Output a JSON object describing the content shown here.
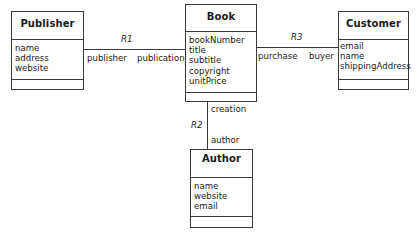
{
  "classes": {
    "publisher": {
      "name": "Publisher",
      "attributes": [
        "name",
        "address",
        "website"
      ]
    },
    "book": {
      "name": "Book",
      "attributes": [
        "bookNumber",
        "title",
        "subtitle",
        "copyright",
        "unitPrice"
      ]
    },
    "customer": {
      "name": "Customer",
      "attributes": [
        "email",
        "name",
        "shippingAddress"
      ]
    },
    "author": {
      "name": "Author",
      "attributes": [
        "name",
        "website",
        "email"
      ]
    }
  },
  "associations": {
    "r1": {
      "name": "R1",
      "left_role": "publisher",
      "right_role": "publication"
    },
    "r2": {
      "name": "R2",
      "top_role": "creation",
      "bottom_role": "author"
    },
    "r3": {
      "name": "R3",
      "left_role": "purchase",
      "right_role": "buyer"
    }
  }
}
